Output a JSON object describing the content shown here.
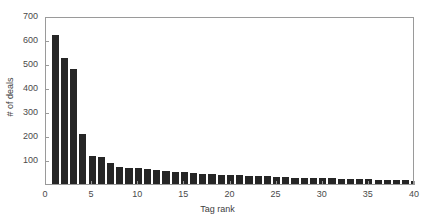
{
  "chart_data": {
    "type": "bar",
    "title": "",
    "xlabel": "Tag rank",
    "ylabel": "# of deals",
    "xlim": [
      0,
      40
    ],
    "ylim": [
      0,
      700
    ],
    "grid": false,
    "legend": null,
    "bar_color": "#262626",
    "axis_color": "#9a9a9a",
    "text_color": "#4a4a4a",
    "xticks": [
      0,
      5,
      10,
      15,
      20,
      25,
      30,
      35,
      40
    ],
    "xtick_labels": [
      "0",
      "5",
      "10",
      "15",
      "20",
      "25",
      "30",
      "35",
      "40"
    ],
    "yticks": [
      100,
      200,
      300,
      400,
      500,
      600,
      700
    ],
    "ytick_labels": [
      "100",
      "200",
      "300",
      "400",
      "500",
      "600",
      "700"
    ],
    "categories": [
      1,
      2,
      3,
      4,
      5,
      6,
      7,
      8,
      9,
      10,
      11,
      12,
      13,
      14,
      15,
      16,
      17,
      18,
      19,
      20,
      21,
      22,
      23,
      24,
      25,
      26,
      27,
      28,
      29,
      30,
      31,
      32,
      33,
      34,
      35,
      36,
      37,
      38,
      39,
      40
    ],
    "values": [
      620,
      525,
      480,
      210,
      115,
      114,
      88,
      72,
      68,
      66,
      62,
      58,
      55,
      50,
      48,
      44,
      42,
      41,
      39,
      38,
      36,
      35,
      33,
      32,
      30,
      28,
      27,
      26,
      25,
      24,
      23,
      22,
      21,
      20,
      19,
      18,
      17,
      16,
      15,
      14
    ]
  }
}
